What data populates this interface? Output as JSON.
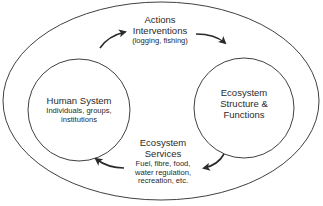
{
  "diagram": {
    "outer_boundary": {
      "label": ""
    },
    "nodes": {
      "human_system": {
        "title": "Human System",
        "subtitle_line1": "Individuals, groups,",
        "subtitle_line2": "institutions"
      },
      "ecosystem": {
        "line1": "Ecosystem",
        "line2": "Structure &",
        "line3": "Functions"
      }
    },
    "flows": {
      "actions": {
        "line1": "Actions",
        "line2": "Interventions",
        "line3": "(logging, fishing)",
        "direction": "Human System → Ecosystem"
      },
      "services": {
        "line1": "Ecosystem",
        "line2": "Services",
        "line3": "Fuel, fibre, food,",
        "line4": "water regulation,",
        "line5": "recreation, etc.",
        "direction": "Ecosystem → Human System"
      }
    },
    "colors": {
      "stroke": "#2a2a2a",
      "background": "#ffffff"
    }
  }
}
